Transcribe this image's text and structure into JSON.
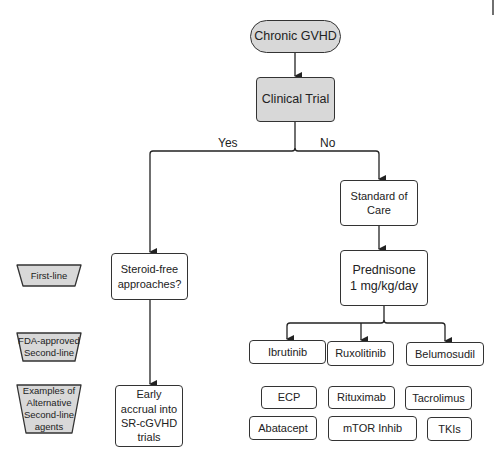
{
  "nodes": {
    "start": "Chronic GVHD",
    "clinical_trial": "Clinical Trial",
    "yes_label": "Yes",
    "no_label": "No",
    "standard_of_care": "Standard of Care",
    "steroid_free": "Steroid-free approaches?",
    "prednisone_line1": "Prednisone",
    "prednisone_line2": "1 mg/kg/day",
    "early_accrual": "Early accrual into SR-cGVHD trials"
  },
  "legend": {
    "first_line": "First-line",
    "fda_approved": "FDA-approved Second-line",
    "examples": "Examples of Alternative Second-line agents"
  },
  "fda_approved_agents": [
    "Ibrutinib",
    "Ruxolitinib",
    "Belumosudil"
  ],
  "alternative_agents": [
    "ECP",
    "Rituximab",
    "Tacrolimus",
    "Abatacept",
    "mTOR Inhib",
    "TKIs"
  ],
  "colors": {
    "gray_fill": "#d8d8d8",
    "stroke": "#333333"
  }
}
